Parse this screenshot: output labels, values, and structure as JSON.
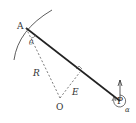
{
  "diagram": {
    "title": "",
    "labels": {
      "point_a": "A",
      "point_o": "O",
      "point_p": "P",
      "radius": "R",
      "perpendicular": "E",
      "angle_at_a": "θ",
      "angle_at_p": "α"
    },
    "colors": {
      "line": "#222222",
      "dashed": "#444444",
      "arc": "#333333",
      "text": "#333333"
    }
  }
}
